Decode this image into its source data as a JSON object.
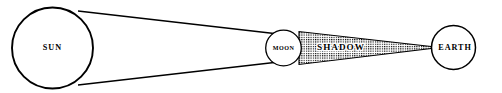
{
  "diagram": {
    "background_color": "#ffffff",
    "stroke_color": "#000000",
    "width": 502,
    "height": 93,
    "bodies": [
      {
        "key": "sun",
        "label": "SUN",
        "shape": "circle",
        "cx": 52.5,
        "cy": 48.0,
        "r": 40.5,
        "stroke_width": 1.9,
        "fill": "#ffffff"
      },
      {
        "key": "moon",
        "label": "MOON",
        "shape": "circle",
        "cx": 283.5,
        "cy": 48.0,
        "r": 17.8,
        "stroke_width": 1.3,
        "fill": "#ffffff"
      },
      {
        "key": "earth",
        "label": "EARTH",
        "shape": "circle",
        "cx": 453.5,
        "cy": 47.5,
        "r": 22.0,
        "stroke_width": 1.5,
        "fill": "#ffffff"
      }
    ],
    "rays": [
      {
        "key": "upper-ray",
        "from_x": 78.0,
        "from_y": 11.0,
        "to_x": 296.0,
        "to_y": 36.0,
        "stroke_width": 1.5
      },
      {
        "key": "lower-ray",
        "from_x": 78.0,
        "from_y": 85.0,
        "to_x": 296.0,
        "to_y": 60.0,
        "stroke_width": 1.5
      }
    ],
    "shadow": {
      "key": "shadow-cone",
      "label": "SHADOW",
      "fill_pattern": "stipple-grid",
      "pattern_color": "#000000",
      "points": "299,31.5 299,64.5 433,48.2 433,46.8",
      "label_x": 341.0,
      "label_y": 47.5
    },
    "labels": {
      "sun_x": 52.5,
      "sun_y": 48.0,
      "moon_x": 283.5,
      "moon_y": 48.0,
      "earth_x": 455.0,
      "earth_y": 47.5
    }
  }
}
